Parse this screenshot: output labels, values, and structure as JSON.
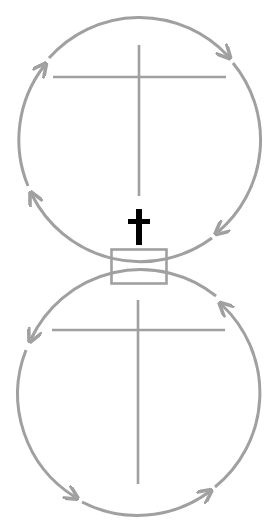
{
  "diagram": {
    "type": "two-circle cycle diagram",
    "colors": {
      "line": "#a0a0a0",
      "cross": "#000000",
      "background": "#ffffff"
    },
    "top_circle": {
      "center": [
        139,
        137
      ],
      "radius": 121,
      "direction": "clockwise",
      "arrow_count": 4,
      "inner_symbol": "cross-lines"
    },
    "bottom_circle": {
      "center": [
        139,
        395
      ],
      "radius": 121,
      "direction": "counterclockwise",
      "arrow_count": 4,
      "inner_symbol": "cross-lines"
    },
    "center_symbol": "christian-cross",
    "junction": "rectangle-box"
  }
}
